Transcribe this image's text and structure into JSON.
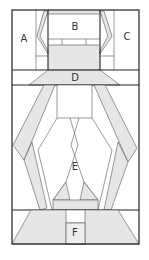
{
  "diagram": {
    "type": "floor-plan-schematic",
    "colors": {
      "stroke": "#222222",
      "thin_stroke": "#555555",
      "fill_gray": "#e6e6e6",
      "background": "#ffffff"
    },
    "regions": [
      {
        "id": "A",
        "label": "A"
      },
      {
        "id": "B",
        "label": "B"
      },
      {
        "id": "C",
        "label": "C"
      },
      {
        "id": "D",
        "label": "D"
      },
      {
        "id": "E",
        "label": "E"
      },
      {
        "id": "F",
        "label": "F"
      }
    ]
  }
}
